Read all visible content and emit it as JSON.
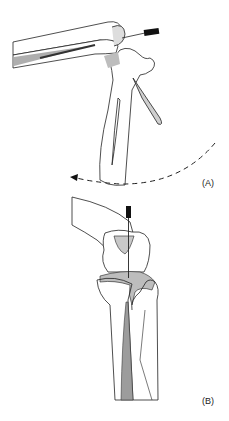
{
  "figure": {
    "panels": [
      {
        "id": "A",
        "label": "(A)",
        "description": "Flexed limb with needle inserted at joint; dashed arrow indicating rotation"
      },
      {
        "id": "B",
        "label": "(B)",
        "description": "Extended joint view with needle inserted vertically into joint space"
      }
    ],
    "colors": {
      "line": "#222222",
      "shade": "#bdbdbd",
      "needle": "#111111"
    }
  }
}
